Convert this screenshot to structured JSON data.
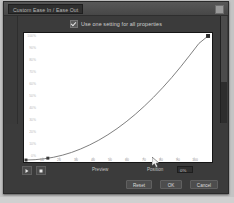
{
  "window": {
    "title": "Custom Ease In / Ease Out",
    "close_button": "close-button"
  },
  "options": {
    "use_one_setting_label": "Use one setting for all properties",
    "use_one_setting_checked": true
  },
  "transport": {
    "play_label": "play",
    "stop_label": "stop",
    "preview_label": "Preview",
    "position_label": "Position",
    "position_value": "0%"
  },
  "footer": {
    "reset_label": "Reset",
    "ok_label": "OK",
    "cancel_label": "Cancel"
  },
  "colors": {
    "dialog_bg": "#3b3b3b",
    "titlebar": "#4f4f4f",
    "plot_bg": "#ffffff",
    "curve": "#6f6f6f",
    "text": "#cfcfcf"
  },
  "chart_data": {
    "type": "line",
    "title": "",
    "xlabel": "",
    "ylabel": "",
    "xlim": [
      0,
      100
    ],
    "ylim": [
      0,
      100
    ],
    "grid": false,
    "legend": "none",
    "ytick_labels": [
      "100%",
      "90%",
      "80%",
      "70%",
      "60%",
      "50%",
      "40%",
      "30%",
      "20%",
      "10%",
      "0%"
    ],
    "ytick_values": [
      100,
      90,
      80,
      70,
      60,
      50,
      40,
      30,
      20,
      10,
      0
    ],
    "xtick_labels": [
      "0",
      "10",
      "20",
      "30",
      "40",
      "50",
      "60",
      "70",
      "80",
      "90",
      "100"
    ],
    "xtick_values": [
      0,
      10,
      20,
      30,
      40,
      50,
      60,
      70,
      80,
      90,
      100
    ],
    "series": [
      {
        "name": "Custom ease curve",
        "x": [
          0,
          5,
          10,
          15,
          20,
          25,
          30,
          35,
          40,
          45,
          50,
          55,
          60,
          65,
          70,
          75,
          80,
          85,
          90,
          95,
          100
        ],
        "values": [
          0,
          0.3,
          1.0,
          2.2,
          3.9,
          6.1,
          8.9,
          12.2,
          16.0,
          20.4,
          25.3,
          30.8,
          36.8,
          43.4,
          50.5,
          58.2,
          66.4,
          75.2,
          84.5,
          94.0,
          100
        ]
      }
    ],
    "control_points": [
      {
        "name": "start-handle",
        "x": 0,
        "y": 0
      },
      {
        "name": "mid-handle",
        "x": 12,
        "y": 1.5
      },
      {
        "name": "end-handle",
        "x": 100,
        "y": 100
      }
    ]
  }
}
